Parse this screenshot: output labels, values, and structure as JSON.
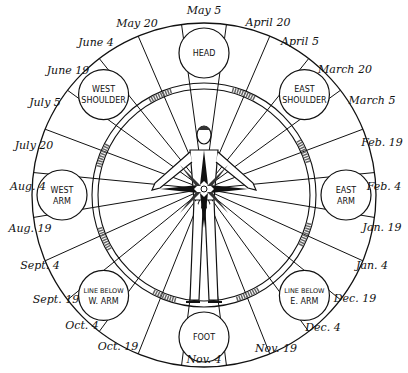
{
  "diagram": {
    "type": "zodiac-wheel-body-diagram",
    "center_figure": "human-figure-with-compass-star",
    "body_regions": [
      {
        "id": "head",
        "lines": [
          "HEAD"
        ],
        "angle": 0
      },
      {
        "id": "east-shoulder",
        "lines": [
          "EAST",
          "SHOULDER"
        ],
        "angle": 45
      },
      {
        "id": "east-arm",
        "lines": [
          "EAST",
          "ARM"
        ],
        "angle": 90
      },
      {
        "id": "line-below-e-arm",
        "lines": [
          "LINE BELOW",
          "E. ARM"
        ],
        "angle": 135
      },
      {
        "id": "foot",
        "lines": [
          "FOOT"
        ],
        "angle": 180
      },
      {
        "id": "line-below-w-arm",
        "lines": [
          "LINE BELOW",
          "W. ARM"
        ],
        "angle": 225
      },
      {
        "id": "west-arm",
        "lines": [
          "WEST",
          "ARM"
        ],
        "angle": 270
      },
      {
        "id": "west-shoulder",
        "lines": [
          "WEST",
          "SHOULDER"
        ],
        "angle": 315
      }
    ],
    "dates": [
      {
        "label": "May 5",
        "x": 204,
        "y": 14
      },
      {
        "label": "April 20",
        "x": 268,
        "y": 26
      },
      {
        "label": "April 5",
        "x": 300,
        "y": 45
      },
      {
        "label": "March 20",
        "x": 345,
        "y": 73
      },
      {
        "label": "March 5",
        "x": 372,
        "y": 104
      },
      {
        "label": "Feb. 19",
        "x": 382,
        "y": 146
      },
      {
        "label": "Feb. 4",
        "x": 384,
        "y": 190
      },
      {
        "label": "Jan. 19",
        "x": 382,
        "y": 231
      },
      {
        "label": "Jan. 4",
        "x": 372,
        "y": 269
      },
      {
        "label": "Dec. 19",
        "x": 355,
        "y": 302
      },
      {
        "label": "Dec. 4",
        "x": 323,
        "y": 331
      },
      {
        "label": "Nov. 19",
        "x": 276,
        "y": 352
      },
      {
        "label": "Nov. 4",
        "x": 204,
        "y": 363
      },
      {
        "label": "Oct. 19",
        "x": 118,
        "y": 350
      },
      {
        "label": "Oct. 4",
        "x": 82,
        "y": 329
      },
      {
        "label": "Sept. 19",
        "x": 56,
        "y": 303
      },
      {
        "label": "Sept. 4",
        "x": 40,
        "y": 269
      },
      {
        "label": "Aug. 19",
        "x": 30,
        "y": 232
      },
      {
        "label": "Aug. 4",
        "x": 28,
        "y": 190
      },
      {
        "label": "July 20",
        "x": 34,
        "y": 149
      },
      {
        "label": "July 5",
        "x": 45,
        "y": 106
      },
      {
        "label": "June 19",
        "x": 68,
        "y": 74
      },
      {
        "label": "June 4",
        "x": 96,
        "y": 46
      },
      {
        "label": "May 20",
        "x": 137,
        "y": 27
      }
    ]
  }
}
